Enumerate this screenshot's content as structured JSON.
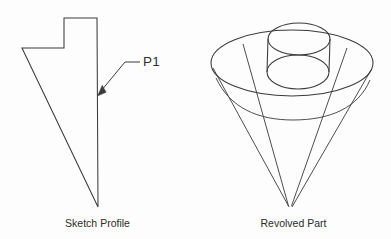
{
  "figure": {
    "background_color": "#fdfdfd",
    "line_color": "#3b3b3b",
    "text_color": "#2b2b2b",
    "width": 391,
    "height": 239
  },
  "sketch": {
    "caption": "Sketch Profile",
    "annotation_label": "P1",
    "profile_points": "22,48 64,48 64,18 97,18 98,207",
    "leader_horizontal": "140,62 125,62",
    "leader_diagonal": "125,62 100,92",
    "arrowhead_points": "97.5,95.5 101.5,85.5 105.5,92.5"
  },
  "revolved": {
    "caption": "Revolved Part",
    "outer_rim": {
      "cx": 292,
      "cy": 63,
      "rx": 81,
      "ry": 33
    },
    "body_arc": "M 216,78 C 230,108 258,120 293,120 C 330,120 358,108 370,80",
    "boss_top": {
      "cx": 299,
      "cy": 39,
      "rx": 31,
      "ry": 16
    },
    "boss_bottom": {
      "cx": 298,
      "cy": 72,
      "rx": 31,
      "ry": 17
    },
    "boss_wall_left": "268,39 267,72",
    "boss_wall_right": "330,39 329,72",
    "cone_left_edge": "213,68 289,207",
    "cone_right_edge": "371,70 292,207",
    "cone_inner_left": "243,44 288,206",
    "cone_inner_right": "347,48 292,206"
  }
}
